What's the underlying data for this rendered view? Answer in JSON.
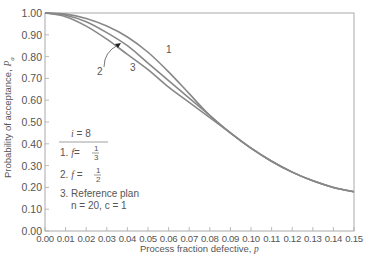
{
  "chart_data": {
    "type": "line",
    "title": "",
    "xlabel": "Process fraction defective, p",
    "ylabel": "Probability of acceptance, Pa",
    "xlim": [
      0,
      0.15
    ],
    "ylim": [
      0,
      1.0
    ],
    "grid": false,
    "x_ticks": [
      "0.00",
      "0.01",
      "0.02",
      "0.03",
      "0.04",
      "0.05",
      "0.06",
      "0.07",
      "0.08",
      "0.09",
      "0.10",
      "0.11",
      "0.12",
      "0.13",
      "0.14",
      "0.15"
    ],
    "y_ticks": [
      "0.00",
      "0.10",
      "0.20",
      "0.30",
      "0.40",
      "0.50",
      "0.60",
      "0.70",
      "0.80",
      "0.90",
      "1.00"
    ],
    "x": [
      0.0,
      0.01,
      0.02,
      0.03,
      0.04,
      0.05,
      0.06,
      0.07,
      0.08,
      0.09,
      0.1,
      0.11,
      0.12,
      0.13,
      0.14,
      0.15
    ],
    "series": [
      {
        "name": "1. f = 1/3",
        "label": "1",
        "values": [
          1.0,
          0.995,
          0.975,
          0.94,
          0.89,
          0.82,
          0.73,
          0.63,
          0.53,
          0.45,
          0.38,
          0.32,
          0.27,
          0.23,
          0.2,
          0.18
        ]
      },
      {
        "name": "2. f = 1/2",
        "label": "2",
        "values": [
          1.0,
          0.99,
          0.96,
          0.91,
          0.85,
          0.77,
          0.69,
          0.61,
          0.53,
          0.45,
          0.38,
          0.32,
          0.27,
          0.23,
          0.2,
          0.18
        ]
      },
      {
        "name": "3. Reference plan n = 20, c = 1",
        "label": "3",
        "values": [
          1.0,
          0.983,
          0.94,
          0.88,
          0.81,
          0.74,
          0.66,
          0.59,
          0.52,
          0.45,
          0.38,
          0.32,
          0.27,
          0.23,
          0.2,
          0.18
        ]
      }
    ],
    "legend": {
      "header": "i = 8",
      "entries": [
        "1. f = 1/3",
        "2. f = 1/2",
        "3. Reference plan",
        "n = 20, c = 1"
      ],
      "position": "inside-left"
    },
    "annotations": [
      "1",
      "2",
      "3"
    ]
  },
  "legend": {
    "header_var": "i",
    "header_val": "= 8",
    "item1_num": "1.",
    "item1_var": "f",
    "item1_eq": "=",
    "item1_num_frac": "1",
    "item1_den_frac": "3",
    "item2_num": "2.",
    "item2_var": "f",
    "item2_eq": "=",
    "item2_num_frac": "1",
    "item2_den_frac": "2",
    "item3_label": "3. Reference plan",
    "item3_params": "n = 20, c = 1"
  },
  "axes": {
    "xlabel": "Process fraction defective,",
    "xlabel_var": "p",
    "ylabel": "Probability of acceptance,",
    "ylabel_var": "P",
    "ylabel_sub": "a"
  },
  "curve_labels": {
    "c1": "1",
    "c2": "2",
    "c3": "3"
  }
}
